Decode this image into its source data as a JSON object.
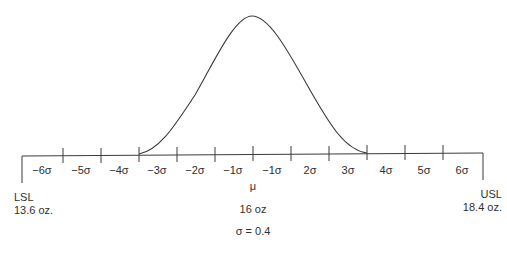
{
  "diagram": {
    "title": "",
    "axis": {
      "tick_labels": [
        "−6σ",
        "−5σ",
        "−4σ",
        "−3σ",
        "−2σ",
        "−1σ",
        "−1σ",
        "2σ",
        "3σ",
        "4σ",
        "5σ",
        "6σ"
      ],
      "mean_symbol": "μ"
    },
    "lsl": {
      "label": "LSL",
      "value": "13.6 oz."
    },
    "usl": {
      "label": "USL",
      "value": "18.4 oz."
    },
    "mean_value": "16 oz",
    "sigma_label": "σ = 0.4",
    "colors": {
      "line": "#3a3a3a",
      "text": "#2f2f2f",
      "background": "#ffffff"
    }
  }
}
